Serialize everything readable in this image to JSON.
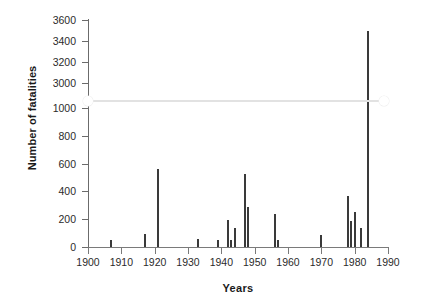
{
  "chart_data": {
    "type": "bar",
    "title": "",
    "xlabel": "Years",
    "ylabel": "Number of fatalities",
    "xlim": [
      1900,
      1990
    ],
    "xticks": [
      1900,
      1910,
      1920,
      1930,
      1940,
      1950,
      1960,
      1970,
      1980,
      1990
    ],
    "yticks": [
      0,
      200,
      400,
      600,
      800,
      1000,
      3000,
      3200,
      3400,
      3600
    ],
    "ylim": [
      0,
      3600
    ],
    "axis_break": {
      "present": true,
      "between": [
        1000,
        3000
      ],
      "style": "horizontal-squiggle"
    },
    "grid": false,
    "legend": null,
    "bar_color": "#3a3a3a",
    "x": [
      1907,
      1917,
      1921,
      1933,
      1939,
      1942,
      1943,
      1944,
      1947,
      1948,
      1956,
      1957,
      1970,
      1978,
      1979,
      1980,
      1982,
      1984
    ],
    "values": [
      50,
      95,
      560,
      60,
      50,
      195,
      50,
      135,
      525,
      290,
      240,
      50,
      85,
      370,
      190,
      250,
      140,
      3500
    ],
    "points": [
      {
        "year": 1907,
        "fatalities": 50
      },
      {
        "year": 1917,
        "fatalities": 95
      },
      {
        "year": 1921,
        "fatalities": 560
      },
      {
        "year": 1933,
        "fatalities": 60
      },
      {
        "year": 1939,
        "fatalities": 50
      },
      {
        "year": 1942,
        "fatalities": 195
      },
      {
        "year": 1943,
        "fatalities": 50
      },
      {
        "year": 1944,
        "fatalities": 135
      },
      {
        "year": 1947,
        "fatalities": 525
      },
      {
        "year": 1948,
        "fatalities": 290
      },
      {
        "year": 1956,
        "fatalities": 240
      },
      {
        "year": 1957,
        "fatalities": 50
      },
      {
        "year": 1970,
        "fatalities": 85
      },
      {
        "year": 1978,
        "fatalities": 370
      },
      {
        "year": 1979,
        "fatalities": 190
      },
      {
        "year": 1980,
        "fatalities": 250
      },
      {
        "year": 1982,
        "fatalities": 140
      },
      {
        "year": 1984,
        "fatalities": 3500
      }
    ]
  },
  "axes": {
    "x_tick_labels": [
      "1900",
      "1910",
      "1920",
      "1930",
      "1940",
      "1950",
      "1960",
      "1970",
      "1980",
      "1990"
    ],
    "y_tick_labels": [
      "0",
      "200",
      "400",
      "600",
      "800",
      "1000",
      "3000",
      "3200",
      "3400",
      "3600"
    ]
  }
}
